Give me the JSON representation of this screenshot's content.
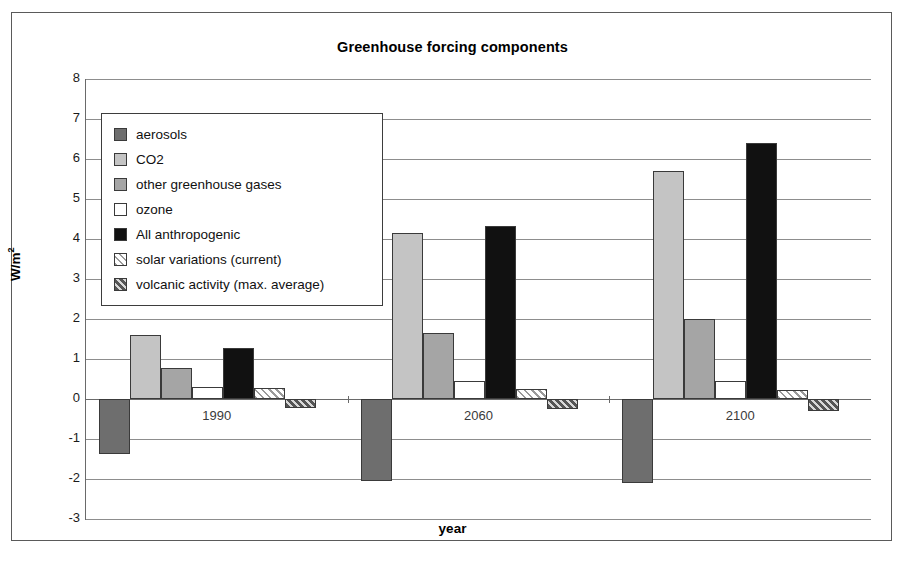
{
  "chart_data": {
    "type": "bar",
    "title": "Greenhouse forcing components",
    "xlabel": "year",
    "ylabel": "W/m2",
    "ylabel_display": "W/m",
    "ylabel_exponent": "2",
    "categories": [
      "1990",
      "2060",
      "2100"
    ],
    "ylim": [
      -3,
      8
    ],
    "ytick_labels": [
      "8",
      "7",
      "6",
      "5",
      "4",
      "3",
      "2",
      "1",
      "0",
      "-1",
      "-2",
      "-3"
    ],
    "yticks": [
      8,
      7,
      6,
      5,
      4,
      3,
      2,
      1,
      0,
      -1,
      -2,
      -3
    ],
    "grid": true,
    "legend_position": "upper-left-inside",
    "series": [
      {
        "name": "aerosols",
        "values": [
          -1.38,
          -2.05,
          -2.1
        ],
        "color": "#6e6e6e",
        "pattern": "solid"
      },
      {
        "name": "CO2",
        "values": [
          1.6,
          4.15,
          5.7
        ],
        "color": "#c4c4c4",
        "pattern": "solid"
      },
      {
        "name": "other greenhouse gases",
        "values": [
          0.78,
          1.65,
          2.0
        ],
        "color": "#a5a5a5",
        "pattern": "solid"
      },
      {
        "name": "ozone",
        "values": [
          0.3,
          0.45,
          0.45
        ],
        "color": "#ffffff",
        "pattern": "solid"
      },
      {
        "name": "All anthropogenic",
        "values": [
          1.27,
          4.33,
          6.4
        ],
        "color": "#111111",
        "pattern": "solid"
      },
      {
        "name": "solar variations (current)",
        "values": [
          0.28,
          0.25,
          0.22
        ],
        "color": "#9a9a9a",
        "pattern": "hatch-light"
      },
      {
        "name": "volcanic activity (max. average)",
        "values": [
          -0.22,
          -0.25,
          -0.3
        ],
        "color": "#555555",
        "pattern": "hatch-dark"
      }
    ]
  }
}
